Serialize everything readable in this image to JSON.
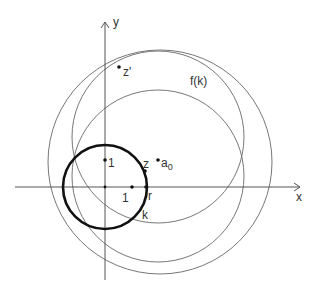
{
  "figure": {
    "axes": {
      "x_label": "x",
      "y_label": "y",
      "origin_px": [
        105,
        187
      ],
      "unit_px": 27
    },
    "unit_circle_label": "k",
    "image_circle_label": "f(k)",
    "points": {
      "unit_y": {
        "label": "1"
      },
      "unit_x": {
        "label": "1"
      },
      "r": {
        "label": "r"
      },
      "z": {
        "label": "z"
      },
      "a0": {
        "label": "a",
        "subscript": "0"
      },
      "z_prime": {
        "label": "z'"
      }
    },
    "colors": {
      "axes": "#555555",
      "thin_circles": "#777777",
      "thick_circle": "#111111",
      "points": "#111111",
      "text": "#333333"
    }
  }
}
